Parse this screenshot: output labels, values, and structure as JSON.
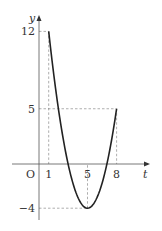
{
  "chart_data": {
    "type": "line",
    "title": "",
    "xlabel": "t",
    "ylabel": "y",
    "origin_label": "O",
    "function": "y = (t - 5)^2 - 4",
    "domain": [
      1,
      8
    ],
    "series": [
      {
        "name": "curve",
        "x": [
          1,
          2,
          3,
          4,
          5,
          6,
          7,
          8
        ],
        "y": [
          12,
          5,
          0,
          -3,
          -4,
          -3,
          0,
          5
        ]
      }
    ],
    "xticks": [
      {
        "value": 1,
        "label": "1"
      },
      {
        "value": 5,
        "label": "5"
      },
      {
        "value": 8,
        "label": "8"
      }
    ],
    "yticks": [
      {
        "value": 12,
        "label": "12"
      },
      {
        "value": 5,
        "label": "5"
      },
      {
        "value": -4,
        "label": "-4"
      }
    ],
    "guides": [
      {
        "from": [
          0,
          12
        ],
        "to": [
          1,
          12
        ]
      },
      {
        "from": [
          1,
          12
        ],
        "to": [
          1,
          0
        ]
      },
      {
        "from": [
          0,
          5
        ],
        "to": [
          8,
          5
        ]
      },
      {
        "from": [
          8,
          5
        ],
        "to": [
          8,
          0
        ]
      },
      {
        "from": [
          0,
          -4
        ],
        "to": [
          5,
          -4
        ]
      },
      {
        "from": [
          5,
          -4
        ],
        "to": [
          5,
          0
        ]
      }
    ],
    "xlim": [
      -2.5,
      10
    ],
    "ylim": [
      -5,
      14
    ],
    "grid": false,
    "legend": "none"
  }
}
